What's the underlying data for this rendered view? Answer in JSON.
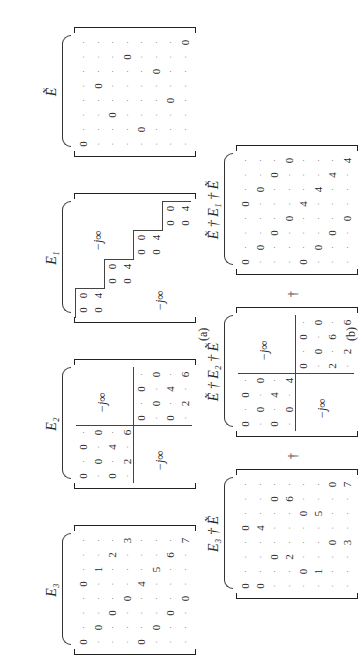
{
  "captions": {
    "a": "(a)",
    "b": "(b)"
  },
  "operator": "†",
  "neg_inf": "−j∞",
  "dot": "·",
  "matrices": {
    "E3": {
      "label": "E₃",
      "rows": [
        [
          "0",
          "·",
          "·",
          "·",
          "0",
          "·",
          "·",
          "·"
        ],
        [
          "·",
          "0",
          "·",
          "·",
          "·",
          "1",
          "·",
          "·"
        ],
        [
          "·",
          "·",
          "0",
          "·",
          "·",
          "·",
          "2",
          "·"
        ],
        [
          "·",
          "·",
          "·",
          "0",
          "·",
          "·",
          "·",
          "3"
        ],
        [
          "0",
          "·",
          "·",
          "·",
          "4",
          "·",
          "·",
          "·"
        ],
        [
          "·",
          "0",
          "·",
          "·",
          "·",
          "5",
          "·",
          "·"
        ],
        [
          "·",
          "·",
          "0",
          "·",
          "·",
          "·",
          "6",
          "·"
        ],
        [
          "·",
          "·",
          "·",
          "0",
          "·",
          "·",
          "·",
          "7"
        ]
      ]
    },
    "E2": {
      "label": "E₂",
      "block_tl": [
        [
          "0",
          "·",
          "0",
          "·"
        ],
        [
          "·",
          "0",
          "·",
          "0"
        ],
        [
          "0",
          "·",
          "4",
          "·"
        ],
        [
          "·",
          "2",
          "·",
          "6"
        ]
      ],
      "block_br": [
        [
          "0",
          "·",
          "0",
          "·"
        ],
        [
          "·",
          "0",
          "·",
          "0"
        ],
        [
          "0",
          "·",
          "4",
          "·"
        ],
        [
          "·",
          "2",
          "·",
          "6"
        ]
      ],
      "off_diag": "−j∞"
    },
    "E1": {
      "label": "E₁",
      "blocks": [
        [
          [
            "0",
            "0"
          ],
          [
            "0",
            "4"
          ]
        ],
        [
          [
            "0",
            "0"
          ],
          [
            "0",
            "4"
          ]
        ],
        [
          [
            "0",
            "0"
          ],
          [
            "0",
            "4"
          ]
        ],
        [
          [
            "0",
            "0"
          ],
          [
            "0",
            "4"
          ]
        ]
      ],
      "off_diag": "−j∞"
    },
    "Etilde": {
      "label": "Ẽ",
      "zeros": [
        [
          0,
          0
        ],
        [
          1,
          4
        ],
        [
          2,
          2
        ],
        [
          3,
          6
        ],
        [
          4,
          1
        ],
        [
          5,
          5
        ],
        [
          6,
          3
        ],
        [
          7,
          7
        ]
      ]
    },
    "E3dagEt": {
      "label": "E₃ † Ẽ",
      "rows": [
        [
          "0",
          "·",
          "·",
          "·",
          "0",
          "·",
          "·",
          "·"
        ],
        [
          "0",
          "·",
          "·",
          "·",
          "4",
          "·",
          "·",
          "·"
        ],
        [
          "·",
          "·",
          "0",
          "·",
          "·",
          "·",
          "0",
          "·"
        ],
        [
          "·",
          "·",
          "2",
          "·",
          "·",
          "·",
          "6",
          "·"
        ],
        [
          "·",
          "0",
          "·",
          "·",
          "·",
          "0",
          "·",
          "·"
        ],
        [
          "·",
          "1",
          "·",
          "·",
          "·",
          "5",
          "·",
          "·"
        ],
        [
          "·",
          "·",
          "·",
          "0",
          "·",
          "·",
          "·",
          "0"
        ],
        [
          "·",
          "·",
          "·",
          "3",
          "·",
          "·",
          "·",
          "7"
        ]
      ]
    },
    "EtdagE2dagEt": {
      "label": "Ẽ † E₂ † Ẽ",
      "block_tl": [
        [
          "0",
          "·",
          "0",
          "·"
        ],
        [
          "·",
          "0",
          "·",
          "0"
        ],
        [
          "0",
          "·",
          "4",
          "·"
        ],
        [
          "·",
          "0",
          "·",
          "4"
        ]
      ],
      "block_br": [
        [
          "0",
          "·",
          "0",
          "·"
        ],
        [
          "·",
          "0",
          "·",
          "0"
        ],
        [
          "2",
          "·",
          "6",
          "·"
        ],
        [
          "·",
          "2",
          "·",
          "6"
        ]
      ],
      "off_diag": "−j∞"
    },
    "EtdagE1dagEt": {
      "label": "Ẽ † E₁ † Ẽ",
      "rows": [
        [
          "0",
          "·",
          "·",
          "·",
          "0",
          "·",
          "·",
          "·"
        ],
        [
          "·",
          "0",
          "·",
          "·",
          "·",
          "0",
          "·",
          "·"
        ],
        [
          "·",
          "·",
          "0",
          "·",
          "·",
          "·",
          "0",
          "·"
        ],
        [
          "·",
          "·",
          "·",
          "0",
          "·",
          "·",
          "·",
          "0"
        ],
        [
          "0",
          "·",
          "·",
          "·",
          "4",
          "·",
          "·",
          "·"
        ],
        [
          "·",
          "0",
          "·",
          "·",
          "·",
          "4",
          "·",
          "·"
        ],
        [
          "·",
          "·",
          "0",
          "·",
          "·",
          "·",
          "4",
          "·"
        ],
        [
          "·",
          "·",
          "·",
          "0",
          "·",
          "·",
          "·",
          "4"
        ]
      ]
    }
  }
}
